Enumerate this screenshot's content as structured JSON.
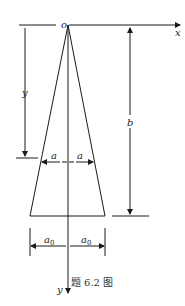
{
  "figure": {
    "caption": "题 6.2 图",
    "origin_label": "o",
    "x_axis_label": "x",
    "y_axis_label": "y",
    "dimensions": {
      "left_depth_label": "y",
      "height_label": "b",
      "half_width_at_y_left": "a",
      "half_width_at_y_right": "a",
      "half_base_left": "a",
      "half_base_left_sub": "0",
      "half_base_right": "a",
      "half_base_right_sub": "0"
    },
    "shape": "isosceles trapezoid / truncated triangle with apex at origin",
    "stroke_color": "#1a1a1a"
  }
}
